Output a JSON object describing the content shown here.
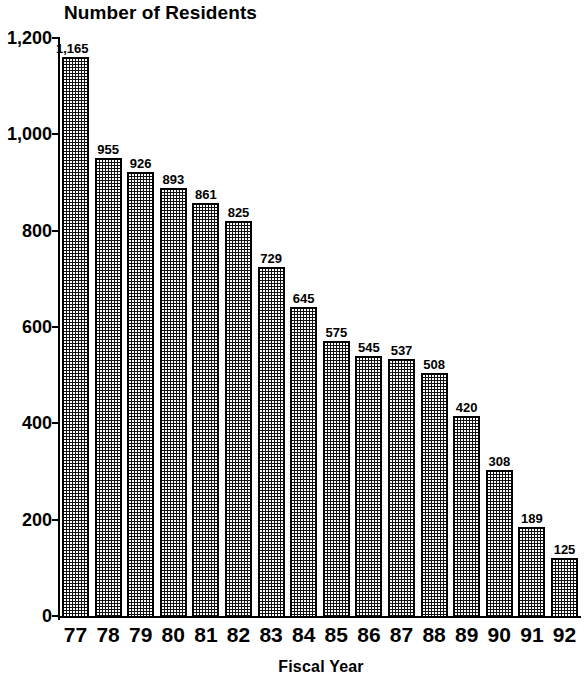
{
  "chart_data": {
    "type": "bar",
    "title": "Number of Residents",
    "xlabel": "Fiscal Year",
    "ylabel": "",
    "categories": [
      "77",
      "78",
      "79",
      "80",
      "81",
      "82",
      "83",
      "84",
      "85",
      "86",
      "87",
      "88",
      "89",
      "90",
      "91",
      "92"
    ],
    "values": [
      1165,
      955,
      926,
      893,
      861,
      825,
      729,
      645,
      575,
      545,
      537,
      508,
      420,
      308,
      189,
      125
    ],
    "value_labels": [
      "1,165",
      "955",
      "926",
      "893",
      "861",
      "825",
      "729",
      "645",
      "575",
      "545",
      "537",
      "508",
      "420",
      "308",
      "189",
      "125"
    ],
    "ylim": [
      0,
      1200
    ],
    "ytick_values": [
      0,
      200,
      400,
      600,
      800,
      1000,
      1200
    ],
    "ytick_labels": [
      "0",
      "200",
      "400",
      "600",
      "800",
      "1,000",
      "1,200"
    ],
    "grid": false,
    "legend": false,
    "bar_fill": "#111111",
    "bar_pattern": "fine-checkerboard-dots",
    "axis_color": "#000000",
    "background": "#ffffff"
  }
}
